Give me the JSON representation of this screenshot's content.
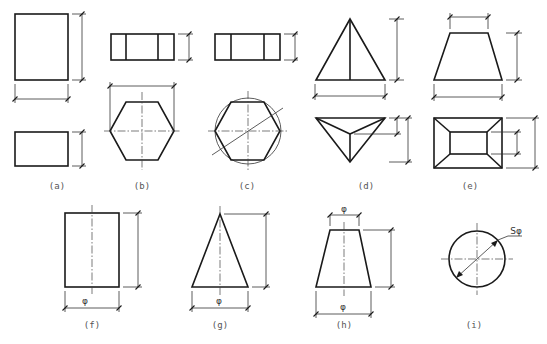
{
  "figure": {
    "panels": [
      {
        "id": "a",
        "label": "(a)",
        "shape": "rectangular prism"
      },
      {
        "id": "b",
        "label": "(b)",
        "shape": "hexagonal prism"
      },
      {
        "id": "c",
        "label": "(c)",
        "shape": "hexagonal prism with circumscribed circle"
      },
      {
        "id": "d",
        "label": "(d)",
        "shape": "triangular pyramid"
      },
      {
        "id": "e",
        "label": "(e)",
        "shape": "frustum of rectangular pyramid"
      },
      {
        "id": "f",
        "label": "(f)",
        "shape": "cylinder",
        "dimension_symbol": "φ"
      },
      {
        "id": "g",
        "label": "(g)",
        "shape": "cone",
        "dimension_symbol": "φ"
      },
      {
        "id": "h",
        "label": "(h)",
        "shape": "frustum of cone",
        "dimension_symbols": [
          "φ",
          "φ"
        ]
      },
      {
        "id": "i",
        "label": "(i)",
        "shape": "sphere",
        "dimension_symbol": "Sφ"
      }
    ]
  },
  "colors": {
    "line": "#1a1a1a",
    "label": "#555555",
    "background": "#ffffff"
  }
}
